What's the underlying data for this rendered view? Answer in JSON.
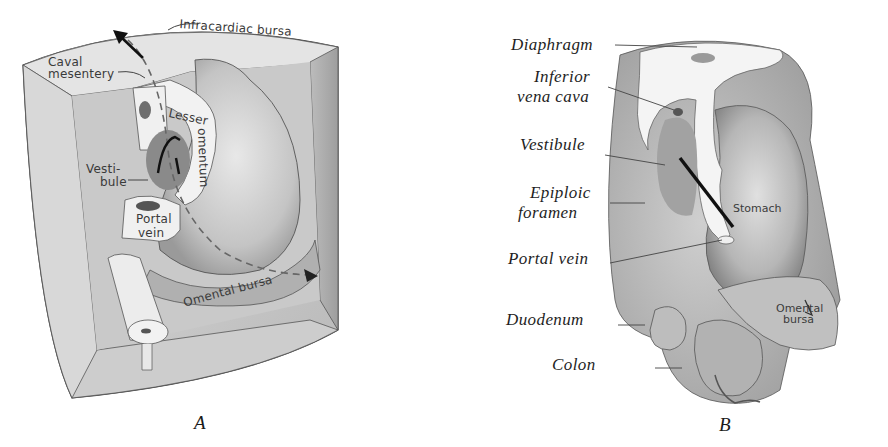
{
  "figure_a": {
    "caption": "A",
    "labels": {
      "infracardiac_bursa": "Infracardiac bursa",
      "caval_mesentery_1": "Caval",
      "caval_mesentery_2": "mesentery",
      "lesser_omentum_1": "Lesser",
      "lesser_omentum_2": "omentum",
      "vestibule_1": "Vesti-",
      "vestibule_2": "bule",
      "portal_vein_1": "Portal",
      "portal_vein_2": "vein",
      "omental_bursa": "Omental bursa"
    }
  },
  "figure_b": {
    "caption": "B",
    "labels": {
      "diaphragm": "Diaphragm",
      "inferior_vena_cava_1": "Inferior",
      "inferior_vena_cava_2": "vena cava",
      "vestibule": "Vestibule",
      "epiploic_foramen_1": "Epiploic",
      "epiploic_foramen_2": "foramen",
      "portal_vein": "Portal vein",
      "duodenum": "Duodenum",
      "colon": "Colon",
      "stomach": "Stomach",
      "omental_bursa_1": "Omental",
      "omental_bursa_2": "bursa"
    }
  },
  "colors": {
    "ink": "#1e1e1e",
    "shade_dark": "#8c8c8c",
    "shade_mid": "#b4b4b4",
    "shade_light": "#d6d6d6",
    "highlight": "#eeeeee"
  }
}
